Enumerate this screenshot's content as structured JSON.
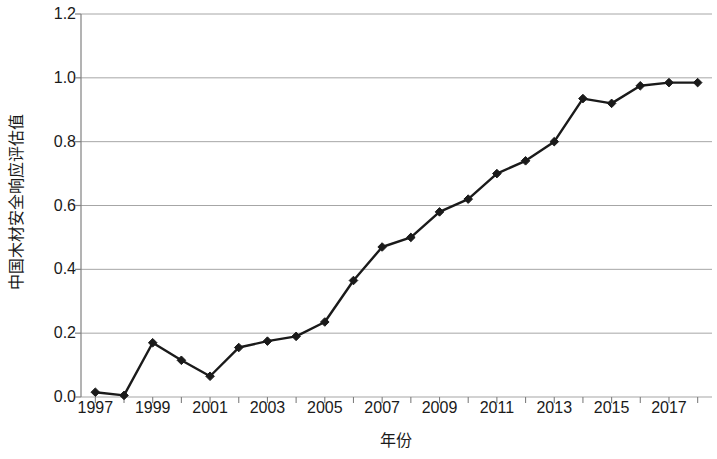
{
  "chart_data": {
    "type": "line",
    "title": "",
    "xlabel": "年份",
    "ylabel": "中国木材安全响应评估值",
    "xlim": [
      1996.5,
      2018.5
    ],
    "ylim": [
      0.0,
      1.2
    ],
    "grid": true,
    "legend": "none",
    "marker": "diamond",
    "line_color": "#1a1a1a",
    "grid_color": "#a6a6a6",
    "axis_color": "#808080",
    "y_ticks": [
      "0.0",
      "0.2",
      "0.4",
      "0.6",
      "0.8",
      "1.0",
      "1.2"
    ],
    "y_tick_values": [
      0.0,
      0.2,
      0.4,
      0.6,
      0.8,
      1.0,
      1.2
    ],
    "x_ticks": [
      "1997",
      "1999",
      "2001",
      "2003",
      "2005",
      "2007",
      "2009",
      "2011",
      "2013",
      "2015",
      "2017"
    ],
    "x_tick_values": [
      1997,
      1999,
      2001,
      2003,
      2005,
      2007,
      2009,
      2011,
      2013,
      2015,
      2017
    ],
    "x": [
      1997,
      1998,
      1999,
      2000,
      2001,
      2002,
      2003,
      2004,
      2005,
      2006,
      2007,
      2008,
      2009,
      2010,
      2011,
      2012,
      2013,
      2014,
      2015,
      2016,
      2017,
      2018
    ],
    "values": [
      0.015,
      0.005,
      0.17,
      0.115,
      0.065,
      0.155,
      0.175,
      0.19,
      0.235,
      0.365,
      0.47,
      0.5,
      0.58,
      0.62,
      0.7,
      0.74,
      0.8,
      0.935,
      0.92,
      0.975,
      0.985,
      0.985
    ],
    "series": [
      {
        "name": "中国木材安全响应评估值",
        "values": [
          0.015,
          0.005,
          0.17,
          0.115,
          0.065,
          0.155,
          0.175,
          0.19,
          0.235,
          0.365,
          0.47,
          0.5,
          0.58,
          0.62,
          0.7,
          0.74,
          0.8,
          0.935,
          0.92,
          0.975,
          0.985,
          0.985
        ]
      }
    ]
  }
}
